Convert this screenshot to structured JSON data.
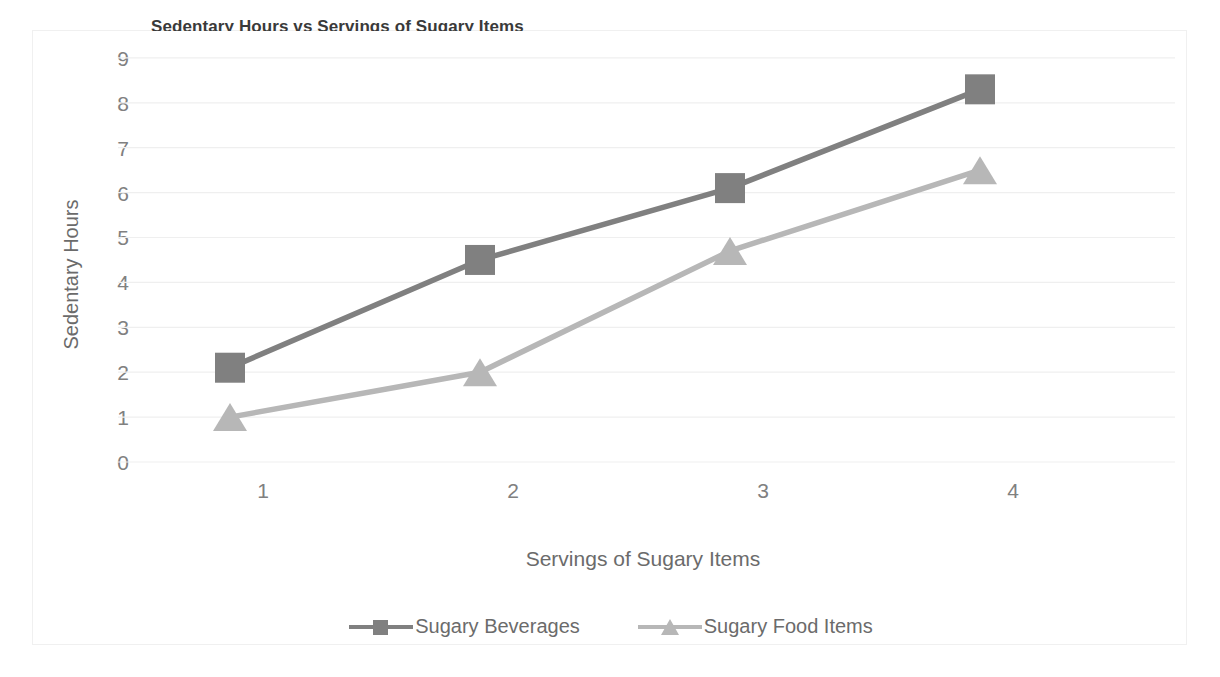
{
  "chart_data": {
    "type": "line",
    "title": "Sedentary Hours vs Servings of Sugary Items",
    "xlabel": "Servings of Sugary Items",
    "ylabel": "Sedentary Hours",
    "x": [
      1,
      2,
      3,
      4
    ],
    "categories": [
      "1",
      "2",
      "3",
      "4"
    ],
    "xtick_labels": [
      "1",
      "2",
      "3",
      "4"
    ],
    "ytick_labels": [
      "0",
      "1",
      "2",
      "3",
      "4",
      "5",
      "6",
      "7",
      "8",
      "9"
    ],
    "ylim": [
      0,
      9
    ],
    "grid": true,
    "grid_axis": "y",
    "legend_position": "bottom",
    "series": [
      {
        "name": "Sugary Beverages",
        "values": [
          2.1,
          4.5,
          6.1,
          8.3
        ],
        "color": "#808080",
        "marker": "square"
      },
      {
        "name": "Sugary Food Items",
        "values": [
          1.0,
          2.0,
          4.7,
          6.5
        ],
        "color": "#b7b7b7",
        "marker": "triangle"
      }
    ]
  },
  "colors": {
    "series_dark": "#808080",
    "series_light": "#b7b7b7",
    "grid": "#efefef",
    "tick_text": "#808080",
    "axis_label_text": "#6b6b6b",
    "frame": "#f0f0f0",
    "background": "#ffffff"
  }
}
